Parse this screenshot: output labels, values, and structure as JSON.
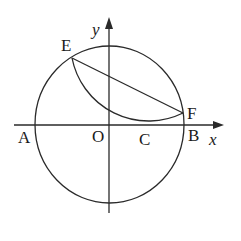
{
  "diagram": {
    "type": "geometry-figure",
    "colors": {
      "stroke": "#2a2a2a",
      "text": "#1a1a1a",
      "background": "#ffffff"
    },
    "axes": {
      "x_label": "x",
      "y_label": "y"
    },
    "points": {
      "A": "A",
      "O": "O",
      "C": "C",
      "B": "B",
      "E": "E",
      "F": "F"
    },
    "elements": [
      {
        "kind": "circle",
        "name": "main circle",
        "center": "O",
        "through": [
          "A",
          "B"
        ]
      },
      {
        "kind": "segment",
        "name": "chord EF",
        "from": "E",
        "to": "F"
      },
      {
        "kind": "arc",
        "name": "folded arc EF",
        "from": "E",
        "to": "F",
        "tangent_to": "x-axis",
        "tangent_point": "C"
      }
    ]
  }
}
